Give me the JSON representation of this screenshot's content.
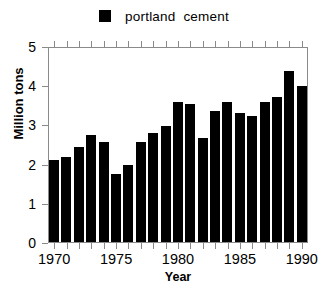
{
  "legend": {
    "swatch_color": "#000000",
    "label": "portland  cement"
  },
  "axes": {
    "ylabel": "Million tons",
    "xlabel": "Year",
    "ytick_labels": [
      "5",
      "4",
      "3",
      "2",
      "1",
      "0"
    ],
    "xtick_labels": [
      "1970",
      "1975",
      "1980",
      "1985",
      "1990"
    ]
  },
  "caption": "",
  "chart_data": {
    "type": "bar",
    "title": "",
    "subtitle": "",
    "xlabel": "Year",
    "ylabel": "Million tons",
    "xlim": [
      1969.4,
      1990.6
    ],
    "ylim": [
      0,
      5
    ],
    "yticks": [
      0,
      1,
      2,
      3,
      4,
      5
    ],
    "xticks": [
      1970,
      1975,
      1980,
      1985,
      1990
    ],
    "grid": false,
    "legend_position": "top-center",
    "bar_color": "#000000",
    "categories": [
      "1970",
      "1971",
      "1972",
      "1973",
      "1974",
      "1975",
      "1976",
      "1977",
      "1978",
      "1979",
      "1980",
      "1981",
      "1982",
      "1983",
      "1984",
      "1985",
      "1986",
      "1987",
      "1988",
      "1989",
      "1990"
    ],
    "series": [
      {
        "name": "portland cement",
        "values": [
          2.1,
          2.17,
          2.42,
          2.72,
          2.56,
          1.73,
          1.96,
          2.54,
          2.78,
          2.97,
          3.58,
          3.53,
          2.66,
          3.34,
          3.57,
          3.3,
          3.21,
          3.58,
          3.7,
          4.36,
          3.97
        ]
      }
    ],
    "units": "million tons"
  }
}
